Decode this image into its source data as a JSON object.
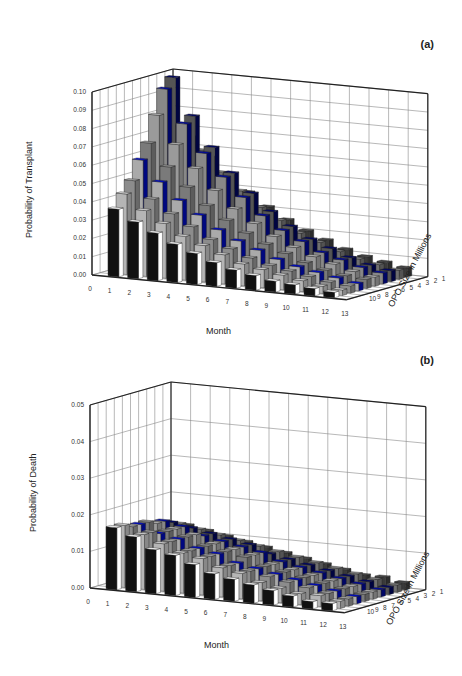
{
  "chart_data": [
    {
      "type": "bar3d",
      "panel_label": "(a)",
      "title": "",
      "ylabel": "Probability of Transplant",
      "xlabel": "Month",
      "zlabel": "OPO Size in Millions",
      "ylim": [
        0,
        0.1
      ],
      "yticks": [
        "0.00",
        "0.01",
        "0.02",
        "0.03",
        "0.04",
        "0.05",
        "0.06",
        "0.07",
        "0.08",
        "0.09",
        "0.10"
      ],
      "xticks": [
        "0",
        "1",
        "2",
        "3",
        "4",
        "5",
        "6",
        "7",
        "8",
        "9",
        "10",
        "11",
        "12",
        "13"
      ],
      "zticks": [
        "1",
        "2",
        "3",
        "4",
        "5",
        "6",
        "7",
        "8",
        "9",
        "10"
      ],
      "categories": [
        1,
        2,
        3,
        4,
        5,
        6,
        7,
        8,
        9,
        10,
        11,
        12
      ],
      "series": [
        {
          "name": "1",
          "values": [
            0.065,
            0.055,
            0.046,
            0.038,
            0.031,
            0.025,
            0.02,
            0.016,
            0.012,
            0.009,
            0.007,
            0.005
          ]
        },
        {
          "name": "2",
          "values": [
            0.072,
            0.06,
            0.049,
            0.04,
            0.032,
            0.026,
            0.02,
            0.016,
            0.012,
            0.009,
            0.007,
            0.005
          ]
        },
        {
          "name": "3",
          "values": [
            0.1,
            0.08,
            0.064,
            0.051,
            0.041,
            0.032,
            0.025,
            0.019,
            0.015,
            0.011,
            0.008,
            0.006
          ]
        },
        {
          "name": "4",
          "values": [
            0.095,
            0.077,
            0.062,
            0.05,
            0.04,
            0.031,
            0.024,
            0.019,
            0.014,
            0.011,
            0.008,
            0.006
          ]
        },
        {
          "name": "5",
          "values": [
            0.082,
            0.067,
            0.055,
            0.044,
            0.035,
            0.028,
            0.022,
            0.017,
            0.013,
            0.01,
            0.007,
            0.005
          ]
        },
        {
          "name": "6",
          "values": [
            0.068,
            0.056,
            0.046,
            0.037,
            0.03,
            0.024,
            0.019,
            0.015,
            0.011,
            0.008,
            0.006,
            0.005
          ]
        },
        {
          "name": "7",
          "values": [
            0.06,
            0.049,
            0.04,
            0.033,
            0.026,
            0.021,
            0.017,
            0.013,
            0.01,
            0.008,
            0.006,
            0.004
          ]
        },
        {
          "name": "8",
          "values": [
            0.05,
            0.041,
            0.034,
            0.028,
            0.022,
            0.018,
            0.014,
            0.011,
            0.009,
            0.007,
            0.005,
            0.004
          ]
        },
        {
          "name": "9",
          "values": [
            0.044,
            0.036,
            0.03,
            0.024,
            0.02,
            0.016,
            0.012,
            0.01,
            0.008,
            0.006,
            0.004,
            0.003
          ]
        },
        {
          "name": "10",
          "values": [
            0.037,
            0.031,
            0.026,
            0.021,
            0.017,
            0.013,
            0.01,
            0.008,
            0.006,
            0.005,
            0.004,
            0.003
          ]
        }
      ]
    },
    {
      "type": "bar3d",
      "panel_label": "(b)",
      "title": "",
      "ylabel": "Probability of Death",
      "xlabel": "Month",
      "zlabel": "OPO Size in Millions",
      "ylim": [
        0,
        0.05
      ],
      "yticks": [
        "0.00",
        "0.01",
        "0.02",
        "0.03",
        "0.04",
        "0.05"
      ],
      "xticks": [
        "0",
        "1",
        "2",
        "3",
        "4",
        "5",
        "6",
        "7",
        "8",
        "9",
        "10",
        "11",
        "12",
        "13"
      ],
      "zticks": [
        "1",
        "2",
        "3",
        "4",
        "5",
        "6",
        "7",
        "8",
        "9",
        "10"
      ],
      "categories": [
        1,
        2,
        3,
        4,
        5,
        6,
        7,
        8,
        9,
        10,
        11,
        12
      ],
      "series": [
        {
          "name": "1",
          "values": [
            0.012,
            0.011,
            0.01,
            0.009,
            0.008,
            0.007,
            0.006,
            0.005,
            0.004,
            0.003,
            0.003,
            0.002
          ]
        },
        {
          "name": "2",
          "values": [
            0.013,
            0.012,
            0.011,
            0.01,
            0.009,
            0.008,
            0.007,
            0.006,
            0.005,
            0.004,
            0.003,
            0.002
          ]
        },
        {
          "name": "3",
          "values": [
            0.014,
            0.013,
            0.012,
            0.011,
            0.01,
            0.008,
            0.007,
            0.006,
            0.005,
            0.004,
            0.003,
            0.002
          ]
        },
        {
          "name": "4",
          "values": [
            0.015,
            0.014,
            0.012,
            0.011,
            0.01,
            0.009,
            0.007,
            0.006,
            0.005,
            0.004,
            0.003,
            0.002
          ]
        },
        {
          "name": "5",
          "values": [
            0.015,
            0.014,
            0.013,
            0.011,
            0.01,
            0.009,
            0.007,
            0.006,
            0.005,
            0.004,
            0.003,
            0.002
          ]
        },
        {
          "name": "6",
          "values": [
            0.016,
            0.014,
            0.013,
            0.011,
            0.01,
            0.009,
            0.007,
            0.006,
            0.005,
            0.004,
            0.003,
            0.002
          ]
        },
        {
          "name": "7",
          "values": [
            0.016,
            0.014,
            0.013,
            0.011,
            0.01,
            0.008,
            0.007,
            0.006,
            0.005,
            0.004,
            0.003,
            0.002
          ]
        },
        {
          "name": "8",
          "values": [
            0.016,
            0.015,
            0.013,
            0.011,
            0.01,
            0.008,
            0.007,
            0.006,
            0.005,
            0.004,
            0.003,
            0.002
          ]
        },
        {
          "name": "9",
          "values": [
            0.017,
            0.015,
            0.013,
            0.011,
            0.01,
            0.008,
            0.007,
            0.005,
            0.004,
            0.003,
            0.003,
            0.002
          ]
        },
        {
          "name": "10",
          "values": [
            0.017,
            0.015,
            0.012,
            0.011,
            0.009,
            0.007,
            0.006,
            0.005,
            0.004,
            0.003,
            0.002,
            0.002
          ]
        }
      ]
    }
  ],
  "panels": {
    "a": {
      "label": "(a)",
      "ylabel": "Probability of Transplant",
      "xlabel": "Month",
      "zlabel": "OPO Size in Millions"
    },
    "b": {
      "label": "(b)",
      "ylabel": "Probability of Death",
      "xlabel": "Month",
      "zlabel": "OPO Size in Millions"
    }
  }
}
